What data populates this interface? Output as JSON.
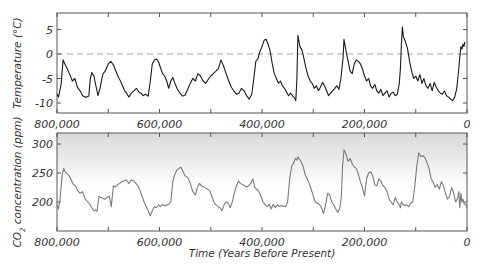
{
  "chart_data": [
    {
      "id": "temperature",
      "type": "line",
      "title": "",
      "xlabel": "",
      "ylabel": "Temperature (°C)",
      "x_reversed": true,
      "xlim": [
        800000,
        0
      ],
      "ylim": [
        -12,
        8
      ],
      "yticks": [
        5,
        0,
        -5,
        -10
      ],
      "xtick_labels": [
        "800,000",
        "600,000",
        "400,000",
        "200,000",
        "0"
      ],
      "xtick_values": [
        800000,
        600000,
        400000,
        200000,
        0
      ],
      "minor_xticks": [
        700000,
        500000,
        300000,
        100000
      ],
      "reference_line": {
        "y": 0,
        "style": "dashed",
        "color": "#9a9a9a"
      },
      "grid": false,
      "line_color": "#1a1a1a",
      "series": [
        {
          "name": "Temperature anomaly",
          "x": [
            800000,
            797000,
            792000,
            788000,
            785000,
            780000,
            775000,
            770000,
            765000,
            760000,
            755000,
            750000,
            745000,
            742000,
            738000,
            735000,
            732000,
            728000,
            725000,
            720000,
            716000,
            712000,
            710000,
            706000,
            700000,
            695000,
            690000,
            685000,
            680000,
            676000,
            672000,
            668000,
            664000,
            660000,
            655000,
            650000,
            645000,
            640000,
            636000,
            632000,
            628000,
            622000,
            618000,
            614000,
            610000,
            606000,
            602000,
            598000,
            594000,
            590000,
            586000,
            582000,
            578000,
            574000,
            570000,
            565000,
            560000,
            555000,
            550000,
            545000,
            540000,
            535000,
            530000,
            525000,
            520000,
            515000,
            510000,
            505000,
            500000,
            495000,
            490000,
            485000,
            480000,
            475000,
            470000,
            465000,
            460000,
            455000,
            450000,
            445000,
            440000,
            435000,
            430000,
            425000,
            420000,
            416000,
            412000,
            408000,
            404000,
            400000,
            396000,
            392000,
            388000,
            384000,
            380000,
            376000,
            372000,
            368000,
            364000,
            360000,
            356000,
            352000,
            348000,
            344000,
            340000,
            336000,
            334000,
            332000,
            330000,
            326000,
            322000,
            318000,
            314000,
            310000,
            306000,
            302000,
            298000,
            294000,
            290000,
            286000,
            282000,
            278000,
            274000,
            270000,
            266000,
            262000,
            258000,
            254000,
            250000,
            246000,
            244000,
            242000,
            240000,
            236000,
            232000,
            228000,
            224000,
            220000,
            216000,
            212000,
            208000,
            204000,
            200000,
            196000,
            192000,
            188000,
            184000,
            180000,
            176000,
            172000,
            168000,
            164000,
            160000,
            156000,
            152000,
            148000,
            144000,
            140000,
            136000,
            132000,
            130000,
            128000,
            126000,
            124000,
            120000,
            116000,
            112000,
            108000,
            104000,
            100000,
            96000,
            92000,
            88000,
            84000,
            80000,
            76000,
            72000,
            68000,
            64000,
            60000,
            56000,
            52000,
            48000,
            44000,
            40000,
            36000,
            32000,
            28000,
            24000,
            20000,
            16000,
            14000,
            12000,
            10000,
            8000,
            6000,
            4000,
            2000,
            0
          ],
          "values": [
            -8.2,
            -8.8,
            -6.2,
            -1.2,
            -2.0,
            -3.0,
            -4.2,
            -5.5,
            -5.0,
            -6.8,
            -7.5,
            -8.5,
            -8.8,
            -8.8,
            -8.6,
            -5.0,
            -3.8,
            -4.5,
            -6.0,
            -8.5,
            -7.0,
            -4.8,
            -4.0,
            -3.5,
            -2.0,
            -1.5,
            -2.2,
            -3.5,
            -4.8,
            -5.5,
            -6.5,
            -7.5,
            -8.0,
            -8.8,
            -8.0,
            -7.5,
            -7.0,
            -7.8,
            -8.0,
            -8.5,
            -8.2,
            -8.6,
            -5.5,
            -2.0,
            -1.2,
            -1.0,
            -1.6,
            -2.8,
            -4.0,
            -4.5,
            -5.5,
            -7.0,
            -5.5,
            -4.8,
            -6.0,
            -7.2,
            -8.0,
            -8.6,
            -8.4,
            -7.2,
            -6.0,
            -5.0,
            -5.5,
            -4.0,
            -4.5,
            -5.5,
            -6.0,
            -5.2,
            -4.5,
            -4.0,
            -3.5,
            -3.0,
            -1.2,
            -2.5,
            -4.0,
            -5.5,
            -6.8,
            -7.5,
            -8.2,
            -8.0,
            -7.0,
            -7.5,
            -8.5,
            -9.2,
            -8.2,
            -5.0,
            -1.5,
            -1.0,
            0.5,
            1.5,
            2.8,
            3.0,
            2.0,
            0.5,
            -2.0,
            -4.0,
            -5.0,
            -6.0,
            -5.5,
            -6.5,
            -7.0,
            -7.8,
            -8.5,
            -8.0,
            -8.6,
            -9.0,
            -9.5,
            -5.0,
            3.8,
            1.5,
            0.8,
            -1.0,
            -3.0,
            -4.5,
            -5.5,
            -6.0,
            -7.0,
            -6.5,
            -7.5,
            -6.8,
            -5.8,
            -6.5,
            -7.5,
            -8.5,
            -8.0,
            -7.5,
            -7.0,
            -6.5,
            -7.2,
            -5.0,
            -3.0,
            -1.0,
            3.0,
            0.5,
            -1.5,
            -3.5,
            -4.0,
            -2.0,
            -1.2,
            -1.5,
            -2.0,
            -3.0,
            -4.5,
            -5.5,
            -5.0,
            -6.5,
            -7.0,
            -6.2,
            -7.5,
            -8.0,
            -7.2,
            -8.5,
            -8.0,
            -7.5,
            -8.8,
            -8.0,
            -7.8,
            -8.5,
            -8.2,
            -6.0,
            -3.0,
            2.0,
            5.5,
            3.5,
            2.5,
            1.0,
            -1.5,
            -3.5,
            -5.0,
            -4.5,
            -5.5,
            -4.2,
            -6.0,
            -5.0,
            -6.5,
            -7.0,
            -6.0,
            -7.5,
            -5.8,
            -6.8,
            -7.5,
            -8.0,
            -8.2,
            -7.5,
            -8.5,
            -8.8,
            -9.2,
            -9.5,
            -8.8,
            -7.0,
            -3.0,
            -0.5,
            1.5,
            1.0,
            2.0,
            1.5,
            2.5
          ]
        }
      ]
    },
    {
      "id": "co2",
      "type": "line",
      "title": "",
      "xlabel": "Time (Years Before Present)",
      "ylabel": "CO2 concentration (ppm)",
      "x_reversed": true,
      "xlim": [
        800000,
        0
      ],
      "ylim": [
        163,
        320
      ],
      "yticks": [
        300,
        250,
        200
      ],
      "xtick_labels": [
        "800,000",
        "600,000",
        "400,000",
        "200,000",
        "0"
      ],
      "xtick_values": [
        800000,
        600000,
        400000,
        200000,
        0
      ],
      "minor_xticks": [
        700000,
        500000,
        300000,
        100000
      ],
      "background": "gradient light gray (top) to white",
      "grid": false,
      "line_color": "#7a7a7a",
      "series": [
        {
          "name": "CO2",
          "x": [
            800000,
            797000,
            794000,
            790000,
            787000,
            784000,
            780000,
            776000,
            772000,
            768000,
            764000,
            760000,
            755000,
            750000,
            745000,
            740000,
            736000,
            732000,
            728000,
            725000,
            722000,
            718000,
            714000,
            710000,
            706000,
            702000,
            698000,
            694000,
            690000,
            686000,
            682000,
            678000,
            674000,
            670000,
            665000,
            660000,
            655000,
            650000,
            646000,
            642000,
            638000,
            634000,
            630000,
            626000,
            622000,
            618000,
            614000,
            610000,
            606000,
            602000,
            598000,
            594000,
            590000,
            586000,
            582000,
            578000,
            574000,
            570000,
            566000,
            562000,
            558000,
            554000,
            550000,
            545000,
            540000,
            535000,
            530000,
            526000,
            522000,
            518000,
            514000,
            510000,
            506000,
            502000,
            498000,
            494000,
            490000,
            486000,
            482000,
            478000,
            474000,
            470000,
            466000,
            462000,
            458000,
            454000,
            450000,
            446000,
            442000,
            438000,
            434000,
            430000,
            426000,
            422000,
            418000,
            414000,
            410000,
            406000,
            402000,
            398000,
            394000,
            390000,
            386000,
            382000,
            378000,
            374000,
            370000,
            366000,
            362000,
            358000,
            354000,
            350000,
            346000,
            342000,
            338000,
            335000,
            332000,
            330000,
            328000,
            324000,
            320000,
            316000,
            312000,
            308000,
            304000,
            300000,
            296000,
            292000,
            288000,
            284000,
            280000,
            276000,
            272000,
            268000,
            264000,
            260000,
            256000,
            252000,
            248000,
            245000,
            243000,
            240000,
            236000,
            232000,
            228000,
            224000,
            220000,
            216000,
            212000,
            208000,
            204000,
            200000,
            196000,
            192000,
            188000,
            184000,
            180000,
            176000,
            172000,
            168000,
            164000,
            160000,
            156000,
            152000,
            148000,
            144000,
            140000,
            136000,
            132000,
            130000,
            128000,
            125000,
            122000,
            118000,
            114000,
            110000,
            106000,
            102000,
            98000,
            94000,
            90000,
            86000,
            82000,
            78000,
            74000,
            70000,
            66000,
            62000,
            58000,
            54000,
            50000,
            46000,
            42000,
            38000,
            34000,
            30000,
            26000,
            22000,
            18000,
            16000,
            14000,
            12000,
            10000,
            8000,
            6000,
            4000,
            2000,
            0
          ],
          "values": [
            195,
            188,
            205,
            245,
            258,
            252,
            248,
            245,
            238,
            230,
            228,
            220,
            215,
            218,
            205,
            200,
            196,
            190,
            185,
            186,
            184,
            210,
            208,
            206,
            205,
            208,
            210,
            192,
            228,
            226,
            230,
            232,
            235,
            236,
            238,
            232,
            238,
            236,
            232,
            228,
            220,
            210,
            200,
            192,
            185,
            176,
            185,
            192,
            190,
            195,
            192,
            196,
            193,
            195,
            196,
            200,
            236,
            248,
            255,
            258,
            260,
            252,
            245,
            242,
            232,
            218,
            212,
            225,
            232,
            228,
            226,
            224,
            222,
            220,
            210,
            200,
            195,
            192,
            190,
            185,
            195,
            200,
            198,
            190,
            200,
            215,
            228,
            236,
            232,
            230,
            228,
            226,
            228,
            232,
            240,
            225,
            222,
            218,
            210,
            200,
            195,
            192,
            196,
            188,
            196,
            190,
            195,
            192,
            194,
            193,
            192,
            200,
            240,
            262,
            268,
            275,
            272,
            278,
            275,
            270,
            262,
            248,
            240,
            232,
            222,
            210,
            200,
            198,
            196,
            190,
            180,
            195,
            215,
            212,
            200,
            195,
            188,
            182,
            190,
            210,
            260,
            290,
            282,
            270,
            275,
            266,
            260,
            258,
            248,
            235,
            225,
            210,
            240,
            250,
            252,
            245,
            230,
            228,
            240,
            236,
            228,
            225,
            218,
            205,
            200,
            195,
            208,
            200,
            195,
            190,
            200,
            196,
            194,
            195,
            192,
            198,
            200,
            225,
            262,
            285,
            278,
            280,
            276,
            268,
            258,
            240,
            234,
            225,
            230,
            222,
            235,
            228,
            215,
            205,
            210,
            225,
            215,
            200,
            208,
            218,
            190,
            215,
            200,
            205,
            198,
            196,
            195,
            190,
            194,
            192,
            210,
            245,
            262,
            268,
            275,
            280
          ]
        }
      ]
    }
  ],
  "labels": {
    "temp_ylabel": "Temperature (°C)",
    "co2_ylabel_prefix": "CO",
    "co2_ylabel_sub": "2",
    "co2_ylabel_suffix": " concentration (ppm)",
    "xlabel": "Time (Years Before Present)",
    "temp_yticks": [
      "5",
      "0",
      "-5",
      "-10"
    ],
    "co2_yticks": [
      "300",
      "250",
      "200"
    ],
    "xticks": [
      "800,000",
      "600,000",
      "400,000",
      "200,000",
      "0"
    ]
  }
}
